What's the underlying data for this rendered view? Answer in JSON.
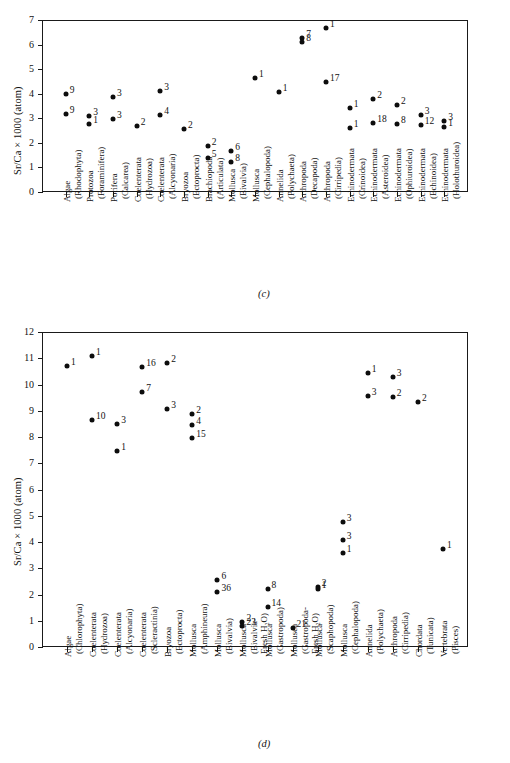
{
  "figure": {
    "panels": [
      {
        "letter": "(c)",
        "ylabel": "Sr/Ca × 1000 (atom)",
        "ylim": [
          0,
          7
        ],
        "yticks": [
          0,
          1,
          2,
          3,
          4,
          5,
          6,
          7
        ],
        "categories": [
          "Algae\n(Rhodophyta)",
          "Protozoa\n(Foraminifera)",
          "Porifera\n(Calcarea)",
          "Coelenterata\n(Hydrozoa)",
          "Coelenterata\n(Alcyonaria)",
          "Bryozoa\n(Ectoprocta)",
          "Brachiopoda\n(Articulata)",
          "Mollusca\n(Bivalvia)",
          "Mollusca\n(Cephalopoda)",
          "Annelida\n(Polychaeta)",
          "Arthropoda\n(Decapoda)",
          "Arthropoda\n(Cirripedia)",
          "Echinodermata\n(Crinoidea)",
          "Echinodermata\n(Asteroidea)",
          "Echinodermata\n(Ophiuroidea)",
          "Echinodermata\n(Echinoidea)",
          "Echinodermata\n(Holothuroidea)"
        ]
      },
      {
        "letter": "(d)",
        "ylabel": "Sr/Ca × 1000 (atom)",
        "ylim": [
          0,
          12
        ],
        "yticks": [
          0,
          1,
          2,
          3,
          4,
          5,
          6,
          7,
          8,
          9,
          10,
          11,
          12
        ],
        "categories": [
          "Algae\n(Chlorophyta)",
          "Coelenterata\n(Hydrozoa)",
          "Coelenterata\n(Alcyonaria)",
          "Coelenterata\n(Scleractinia)",
          "Bryozoa\n(Ectoprocta)",
          "Mollusca\n(Amphineura)",
          "Mollusca\n(Bivalvia)",
          "Mollusca\n(Bivalvia-\nFresh H₂O)",
          "Mollusca\n(Gastropoda)",
          "Mollusca\n(Gastropoda-\nFresh H₂O)",
          "Mollusca\n(Scaphopoda)",
          "Mollusca\n(Cephalopoda)",
          "Annelida\n(Polychaeta)",
          "Arthropoda\n(Cirripedia)",
          "Chordata\n(Tunicata)",
          "Vertebrata\n(Pisces)"
        ]
      }
    ]
  },
  "chart_data": [
    {
      "type": "scatter",
      "panel": "(c)",
      "title": "",
      "xlabel": "",
      "ylabel": "Sr/Ca × 1000 (atom)",
      "ylim": [
        0,
        7
      ],
      "yticks": [
        0,
        1,
        2,
        3,
        4,
        5,
        6,
        7
      ],
      "grid": false,
      "legend": "none",
      "categories": [
        "Algae (Rhodophyta)",
        "Protozoa (Foraminifera)",
        "Porifera (Calcarea)",
        "Coelenterata (Hydrozoa)",
        "Coelenterata (Alcyonaria)",
        "Bryozoa (Ectoprocta)",
        "Brachiopoda (Articulata)",
        "Mollusca (Bivalvia)",
        "Mollusca (Cephalopoda)",
        "Annelida (Polychaeta)",
        "Arthropoda (Decapoda)",
        "Arthropoda (Cirripedia)",
        "Echinodermata (Crinoidea)",
        "Echinodermata (Asteroidea)",
        "Echinodermata (Ophiuroidea)",
        "Echinodermata (Echinoidea)",
        "Echinodermata (Holothuroidea)"
      ],
      "points": [
        {
          "cat": 0,
          "y": 3.97,
          "n": "9",
          "lp": "r"
        },
        {
          "cat": 0,
          "y": 3.17,
          "n": "9",
          "lp": "r"
        },
        {
          "cat": 1,
          "y": 3.08,
          "n": "3",
          "lp": "r"
        },
        {
          "cat": 1,
          "y": 2.75,
          "n": "1",
          "lp": "r"
        },
        {
          "cat": 2,
          "y": 3.85,
          "n": "3",
          "lp": "r"
        },
        {
          "cat": 2,
          "y": 2.98,
          "n": "3",
          "lp": "r"
        },
        {
          "cat": 3,
          "y": 2.69,
          "n": "2",
          "lp": "r"
        },
        {
          "cat": 4,
          "y": 4.11,
          "n": "3",
          "lp": "r"
        },
        {
          "cat": 4,
          "y": 3.13,
          "n": "4",
          "lp": "r"
        },
        {
          "cat": 5,
          "y": 2.57,
          "n": "2",
          "lp": "r"
        },
        {
          "cat": 6,
          "y": 1.88,
          "n": "2",
          "lp": "r"
        },
        {
          "cat": 6,
          "y": 1.37,
          "n": "5",
          "lp": "r"
        },
        {
          "cat": 7,
          "y": 1.65,
          "n": "6",
          "lp": "r"
        },
        {
          "cat": 7,
          "y": 1.22,
          "n": "8",
          "lp": "r"
        },
        {
          "cat": 8,
          "y": 4.62,
          "n": "1",
          "lp": "r"
        },
        {
          "cat": 9,
          "y": 4.08,
          "n": "1",
          "lp": "r"
        },
        {
          "cat": 10,
          "y": 6.27,
          "n": "7",
          "lp": "r"
        },
        {
          "cat": 10,
          "y": 6.1,
          "n": "8",
          "lp": "r"
        },
        {
          "cat": 11,
          "y": 6.68,
          "n": "1",
          "lp": "r"
        },
        {
          "cat": 11,
          "y": 4.48,
          "n": "17",
          "lp": "r"
        },
        {
          "cat": 12,
          "y": 3.4,
          "n": "1",
          "lp": "r"
        },
        {
          "cat": 12,
          "y": 2.61,
          "n": "1",
          "lp": "r"
        },
        {
          "cat": 13,
          "y": 3.77,
          "n": "2",
          "lp": "r"
        },
        {
          "cat": 13,
          "y": 2.79,
          "n": "18",
          "lp": "r"
        },
        {
          "cat": 14,
          "y": 3.54,
          "n": "2",
          "lp": "r"
        },
        {
          "cat": 14,
          "y": 2.76,
          "n": "8",
          "lp": "r"
        },
        {
          "cat": 15,
          "y": 3.15,
          "n": "3",
          "lp": "r"
        },
        {
          "cat": 15,
          "y": 2.72,
          "n": "12",
          "lp": "r"
        },
        {
          "cat": 16,
          "y": 2.87,
          "n": "3",
          "lp": "r"
        },
        {
          "cat": 16,
          "y": 2.65,
          "n": "1",
          "lp": "r"
        }
      ]
    },
    {
      "type": "scatter",
      "panel": "(d)",
      "title": "",
      "xlabel": "",
      "ylabel": "Sr/Ca × 1000 (atom)",
      "ylim": [
        0,
        12
      ],
      "yticks": [
        0,
        1,
        2,
        3,
        4,
        5,
        6,
        7,
        8,
        9,
        10,
        11,
        12
      ],
      "grid": false,
      "legend": "none",
      "categories": [
        "Algae (Chlorophyta)",
        "Coelenterata (Hydrozoa)",
        "Coelenterata (Alcyonaria)",
        "Coelenterata (Scleractinia)",
        "Bryozoa (Ectoprocta)",
        "Mollusca (Amphineura)",
        "Mollusca (Bivalvia)",
        "Mollusca (Bivalvia-Fresh H2O)",
        "Mollusca (Gastropoda)",
        "Mollusca (Gastropoda-Fresh H2O)",
        "Mollusca (Scaphopoda)",
        "Mollusca (Cephalopoda)",
        "Annelida (Polychaeta)",
        "Arthropoda (Cirripedia)",
        "Chordata (Tunicata)",
        "Vertebrata (Pisces)"
      ],
      "points": [
        {
          "cat": 0,
          "y": 10.7,
          "n": "1",
          "lp": "r"
        },
        {
          "cat": 1,
          "y": 11.1,
          "n": "1",
          "lp": "r"
        },
        {
          "cat": 1,
          "y": 8.63,
          "n": "10",
          "lp": "r"
        },
        {
          "cat": 2,
          "y": 8.5,
          "n": "3",
          "lp": "r"
        },
        {
          "cat": 2,
          "y": 7.45,
          "n": "1",
          "lp": "r"
        },
        {
          "cat": 3,
          "y": 10.68,
          "n": "16",
          "lp": "r"
        },
        {
          "cat": 3,
          "y": 9.7,
          "n": "7",
          "lp": "r"
        },
        {
          "cat": 4,
          "y": 10.82,
          "n": "2",
          "lp": "r"
        },
        {
          "cat": 4,
          "y": 9.08,
          "n": "3",
          "lp": "r"
        },
        {
          "cat": 5,
          "y": 8.89,
          "n": "2",
          "lp": "r"
        },
        {
          "cat": 5,
          "y": 8.45,
          "n": "4",
          "lp": "r"
        },
        {
          "cat": 5,
          "y": 7.95,
          "n": "15",
          "lp": "r"
        },
        {
          "cat": 6,
          "y": 2.56,
          "n": "6",
          "lp": "r"
        },
        {
          "cat": 6,
          "y": 2.08,
          "n": "36",
          "lp": "r"
        },
        {
          "cat": 7,
          "y": 0.97,
          "n": "2",
          "lp": "r"
        },
        {
          "cat": 7,
          "y": 0.8,
          "n": "23",
          "lp": "r"
        },
        {
          "cat": 8,
          "y": 2.22,
          "n": "8",
          "lp": "r"
        },
        {
          "cat": 8,
          "y": 1.53,
          "n": "14",
          "lp": "r"
        },
        {
          "cat": 9,
          "y": 0.72,
          "n": "21",
          "lp": "r"
        },
        {
          "cat": 10,
          "y": 2.28,
          "n": "2",
          "lp": "r"
        },
        {
          "cat": 10,
          "y": 2.2,
          "n": "1",
          "lp": "r"
        },
        {
          "cat": 11,
          "y": 4.76,
          "n": "3",
          "lp": "r"
        },
        {
          "cat": 11,
          "y": 4.08,
          "n": "3",
          "lp": "r"
        },
        {
          "cat": 11,
          "y": 3.57,
          "n": "1",
          "lp": "r"
        },
        {
          "cat": 12,
          "y": 10.44,
          "n": "1",
          "lp": "r"
        },
        {
          "cat": 12,
          "y": 9.55,
          "n": "3",
          "lp": "r"
        },
        {
          "cat": 13,
          "y": 10.28,
          "n": "3",
          "lp": "r"
        },
        {
          "cat": 13,
          "y": 9.52,
          "n": "2",
          "lp": "r"
        },
        {
          "cat": 14,
          "y": 9.35,
          "n": "2",
          "lp": "r"
        },
        {
          "cat": 15,
          "y": 3.73,
          "n": "1",
          "lp": "r"
        }
      ]
    }
  ]
}
